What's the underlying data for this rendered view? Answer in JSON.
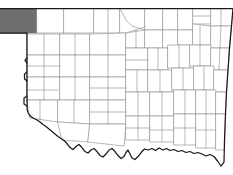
{
  "figure": {
    "type": "choropleth-locator-map",
    "width_px": 233,
    "height_px": 175,
    "title": "",
    "caption": "",
    "labels_visible": false
  },
  "colors": {
    "background": "#ffffff",
    "county_fill": "#ffffff",
    "county_stroke": "#9a9a9a",
    "state_outline": "#1a1a1a",
    "highlight_fill": "#6f6f6f",
    "highlight_stroke": "#6b6b6b"
  },
  "legend": {
    "visible": false,
    "entries": []
  },
  "highlight": {
    "count": 1,
    "name": "cimarron-county",
    "position": "far-northwest-panhandle",
    "fill": "#6f6f6f"
  },
  "geometry": {
    "state_outline": "M 62.5,8.5 L 233,8.5 L 233,9.5 L 231,30 L 228.5,55 L 227,78 L 226,100 L 225,120 L 224.5,140 L 224,162 L 221,166 L 217,162 L 213,157 L 209,155 L 205,156 L 200,154 L 195,152 L 190,153 L 185,151 L 180,152 L 175,150 L 170,151 L 166,149 L 162,150 L 158,148 L 154,150 L 150,148 L 146,150 L 142,149 L 139,152 L 136,156 L 133,159 L 130,157 L 128,153 L 126,149 L 124,152 L 122,156 L 119,158 L 116,155 L 113,151 L 110,148 L 107,150 L 104,154 L 101,157 L 98,155 L 95,151 L 92,148 L 89,150 L 86,153 L 83,151 L 80,147 L 77,144 L 74,146 L 71,149 L 68,147 L 65,143 L 62,140 L 59,138 L 56,136 L 53,134 L 50,131 L 47,128 L 44,126 L 41,124 L 38,121 L 35,119 L 32,118 L 30,116 L 28.5,114 L 27.5,112 L 27,109 L 27,94 L 27,72 L 27,52 L 27,34 L 27,33 L 0,33 L 0,8.5 Z",
    "panhandle_south_edge_y": 33,
    "north_edge_y": 8.5,
    "east_edge_x": 233,
    "west_edge_x": 0,
    "highlight_rect": {
      "x": 0,
      "y": 8.5,
      "w": 37,
      "h": 24.5
    }
  },
  "counties": {
    "total_drawn": 77,
    "panhandle": [
      {
        "name": "cimarron-county",
        "highlighted": true
      },
      {
        "name": "texas-county",
        "highlighted": false
      },
      {
        "name": "beaver-county",
        "highlighted": false
      }
    ]
  },
  "annotations": []
}
